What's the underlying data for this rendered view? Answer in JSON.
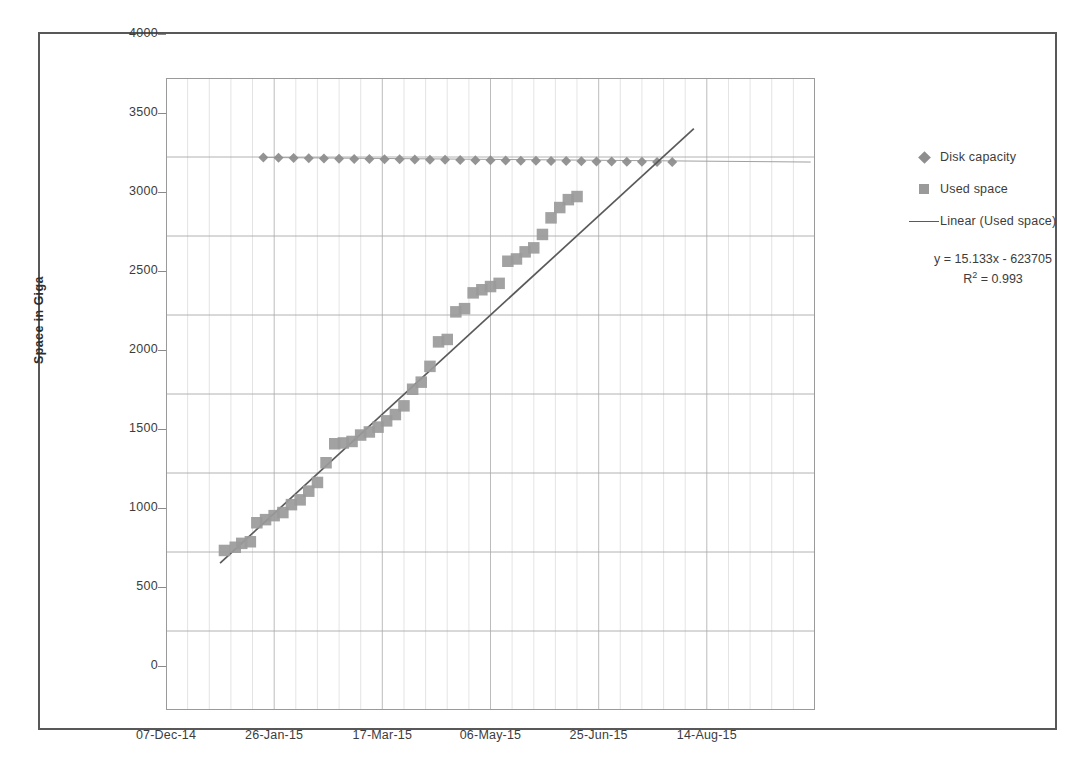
{
  "chart_data": {
    "type": "scatter",
    "title": "",
    "xlabel": "",
    "ylabel": "Space in Giga",
    "ylim": [
      0,
      4000
    ],
    "ytick_step": 500,
    "yticks": [
      "4000",
      "3500",
      "3000",
      "2500",
      "2000",
      "1500",
      "1000",
      "500",
      "0"
    ],
    "xticks": [
      "07-Dec-14",
      "26-Jan-15",
      "17-Mar-15",
      "06-May-15",
      "25-Jun-15",
      "14-Aug-15"
    ],
    "xlim_days": [
      0,
      300
    ],
    "xtick_days": [
      0,
      50,
      100,
      150,
      200,
      250
    ],
    "grid": true,
    "legend_position": "right",
    "series": [
      {
        "name": "Disk capacity",
        "marker": "diamond",
        "color": "#8e8e8e",
        "x": [
          45,
          52,
          59,
          66,
          73,
          80,
          87,
          94,
          101,
          108,
          115,
          122,
          129,
          136,
          143,
          150,
          157,
          164,
          171,
          178,
          185,
          192,
          199,
          206,
          213,
          220,
          227,
          234
        ],
        "values": [
          3497,
          3495,
          3493,
          3492,
          3490,
          3489,
          3488,
          3487,
          3486,
          3485,
          3484,
          3483,
          3482,
          3481,
          3480,
          3479,
          3478,
          3477,
          3476,
          3475,
          3474,
          3473,
          3472,
          3471,
          3470,
          3470,
          3469,
          3468
        ]
      },
      {
        "name": "Used space",
        "marker": "square",
        "color": "#9a9a9a",
        "x": [
          27,
          32,
          35,
          39,
          42,
          46,
          50,
          54,
          58,
          62,
          66,
          70,
          74,
          78,
          82,
          86,
          90,
          94,
          98,
          102,
          106,
          110,
          114,
          118,
          122,
          126,
          130,
          134,
          138,
          142,
          146,
          150,
          154,
          158,
          162,
          166,
          170,
          174,
          178,
          182,
          186,
          190
        ],
        "values": [
          1010,
          1030,
          1055,
          1065,
          1185,
          1205,
          1230,
          1250,
          1300,
          1330,
          1385,
          1440,
          1565,
          1685,
          1690,
          1700,
          1740,
          1760,
          1790,
          1830,
          1870,
          1925,
          2030,
          2075,
          2175,
          2330,
          2345,
          2520,
          2540,
          2640,
          2660,
          2680,
          2700,
          2840,
          2855,
          2900,
          2925,
          3010,
          3115,
          3180,
          3230,
          3250
        ]
      }
    ],
    "trendline": {
      "name": "Linear (Used space)",
      "color": "#5a5a5a",
      "equation": "y = 15.133x - 623705",
      "r_squared_label": "R",
      "r_squared_sup": "2",
      "r_squared_value": "= 0.993",
      "slope_per_day": 15.133,
      "x_start_days": 25,
      "x_end_days": 244,
      "y_start": 930,
      "y_end": 3680
    },
    "legend_entries": [
      {
        "label": "Disk capacity",
        "marker": "diamond"
      },
      {
        "label": "Used space",
        "marker": "square"
      },
      {
        "label": "Linear (Used space)",
        "marker": "line"
      }
    ]
  }
}
